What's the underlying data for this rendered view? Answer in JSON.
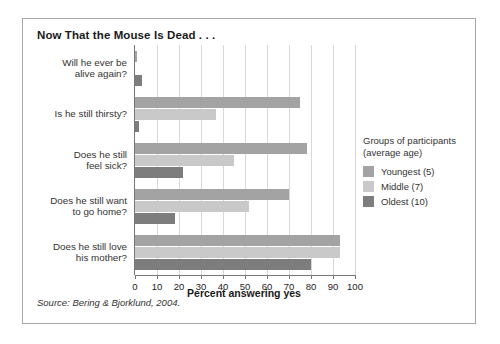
{
  "figure": {
    "title": "Now That the Mouse Is Dead . . .",
    "source": "Source: Bering & Bjorklund, 2004."
  },
  "legend": {
    "title": "Groups of participants\n(average age)",
    "entries": [
      {
        "label": "Youngest (5)",
        "color": "#a3a3a3"
      },
      {
        "label": "Middle (7)",
        "color": "#c9c9c9"
      },
      {
        "label": "Oldest (10)",
        "color": "#7d7d7d"
      }
    ]
  },
  "chart_data": {
    "type": "bar",
    "orientation": "horizontal",
    "title": "Now That the Mouse Is Dead . . .",
    "xlabel": "Percent answering yes",
    "ylabel": "",
    "xlim": [
      0,
      100
    ],
    "xticks": [
      0,
      10,
      20,
      30,
      40,
      50,
      60,
      70,
      80,
      90,
      100
    ],
    "grid": true,
    "legend_position": "right",
    "categories": [
      "Will he ever be\nalive again?",
      "Is he still thirsty?",
      "Does he still\nfeel sick?",
      "Does he still want\nto go home?",
      "Does he still love\nhis mother?"
    ],
    "series": [
      {
        "name": "Youngest (5)",
        "color": "#a3a3a3",
        "values": [
          1,
          75,
          78,
          70,
          93
        ]
      },
      {
        "name": "Middle (7)",
        "color": "#c9c9c9",
        "values": [
          0,
          37,
          45,
          52,
          93
        ]
      },
      {
        "name": "Oldest (10)",
        "color": "#7d7d7d",
        "values": [
          3,
          2,
          22,
          18,
          80
        ]
      }
    ],
    "source": "Source: Bering & Bjorklund, 2004."
  }
}
